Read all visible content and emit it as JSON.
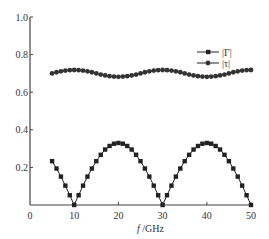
{
  "chart_data": {
    "type": "line",
    "title": "",
    "xlabel": "f /GHz",
    "ylabel": "",
    "xlim": [
      0,
      50
    ],
    "ylim": [
      0,
      1.0
    ],
    "x_ticks": [
      "0",
      "10",
      "20",
      "30",
      "40",
      "50"
    ],
    "y_ticks": [
      "0.2",
      "0.4",
      "0.6",
      "0.8",
      "1.0"
    ],
    "grid": false,
    "legend_position": "upper right",
    "x": [
      5,
      6,
      7,
      8,
      9,
      10,
      11,
      12,
      13,
      14,
      15,
      16,
      17,
      18,
      19,
      20,
      21,
      22,
      23,
      24,
      25,
      26,
      27,
      28,
      29,
      30,
      31,
      32,
      33,
      34,
      35,
      36,
      37,
      38,
      39,
      40,
      41,
      42,
      43,
      44,
      45,
      46,
      47,
      48,
      49,
      50
    ],
    "series": [
      {
        "name": "|Γ|",
        "marker": "square",
        "values": [
          0.233,
          0.194,
          0.151,
          0.103,
          0.052,
          0.0,
          0.052,
          0.103,
          0.151,
          0.194,
          0.233,
          0.267,
          0.295,
          0.314,
          0.326,
          0.33,
          0.326,
          0.314,
          0.295,
          0.267,
          0.233,
          0.194,
          0.151,
          0.103,
          0.052,
          0.0,
          0.052,
          0.103,
          0.151,
          0.194,
          0.233,
          0.267,
          0.295,
          0.314,
          0.326,
          0.33,
          0.326,
          0.314,
          0.295,
          0.267,
          0.233,
          0.194,
          0.151,
          0.103,
          0.052,
          0.0
        ]
      },
      {
        "name": "|τ|",
        "marker": "circle",
        "values": [
          0.7,
          0.706,
          0.711,
          0.715,
          0.717,
          0.718,
          0.717,
          0.715,
          0.711,
          0.706,
          0.7,
          0.694,
          0.689,
          0.685,
          0.683,
          0.682,
          0.683,
          0.685,
          0.689,
          0.694,
          0.7,
          0.706,
          0.711,
          0.715,
          0.717,
          0.718,
          0.717,
          0.715,
          0.711,
          0.706,
          0.7,
          0.694,
          0.689,
          0.685,
          0.683,
          0.682,
          0.683,
          0.685,
          0.689,
          0.694,
          0.7,
          0.706,
          0.711,
          0.715,
          0.717,
          0.718
        ]
      }
    ]
  },
  "axes": {
    "x_label_italic": "f",
    "x_label_unit": " /GHz",
    "origin_label": "0"
  },
  "legend": {
    "items": [
      {
        "label": "|Γ|",
        "marker": "square"
      },
      {
        "label": "|τ|",
        "marker": "circle"
      }
    ]
  },
  "colors": {
    "axis": "#444444",
    "series": "#222222"
  }
}
